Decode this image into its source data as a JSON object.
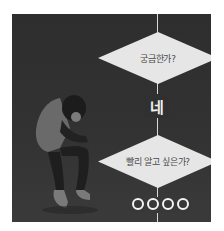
{
  "flowchart": {
    "question_1": "궁금한가?",
    "answer_1": "네",
    "question_2": "빨리 알고 싶은가?",
    "answer_2": "ㅇㅇㅇㅇ",
    "answer_2_symbol_count": 4
  },
  "illustration": {
    "subject": "crouching-person"
  },
  "colors": {
    "background": "#303030",
    "diamond_fill": "#e6e6e6",
    "line": "#d8d8d8",
    "text_light": "#f2f2f2",
    "text_dark": "#4a4a4a"
  }
}
